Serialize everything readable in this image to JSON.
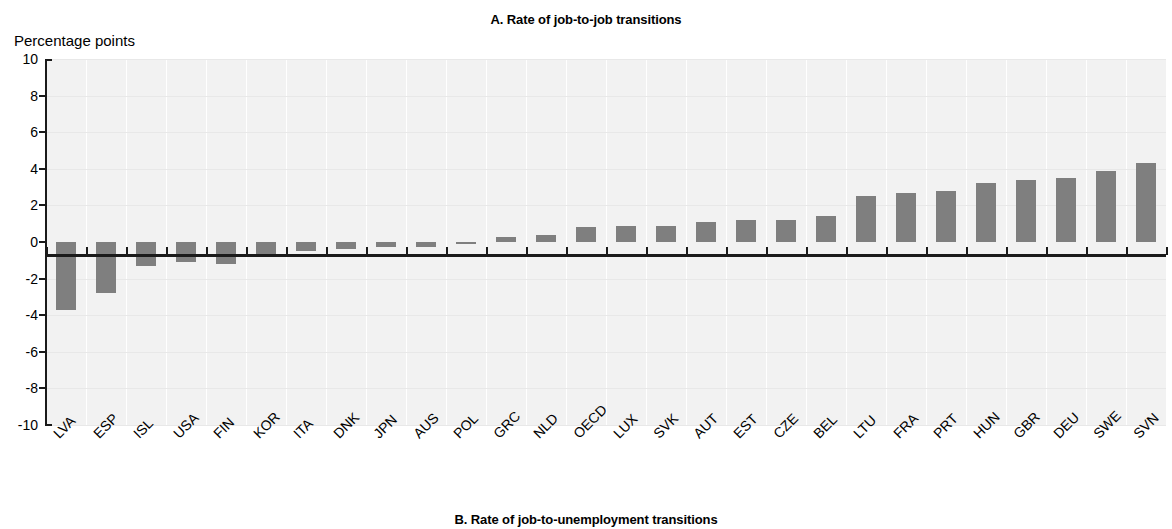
{
  "panel": {
    "title": "A. Rate of job-to-job transitions",
    "next_panel_title": "B. Rate of job-to-unemployment transitions",
    "axis_unit": "Percentage points"
  },
  "colors": {
    "bar": "#7f7f7f",
    "axis": "#1a1a1a",
    "plot_background": "#f2f2f2",
    "gridline": "#ffffff",
    "page_background": "#ffffff"
  },
  "chart_data": {
    "type": "bar",
    "title": "A. Rate of job-to-job transitions",
    "xlabel": "",
    "ylabel": "Percentage points",
    "ylim": [
      -10,
      10
    ],
    "ytick_labels": [
      "10",
      "8",
      "6",
      "4",
      "2",
      "0",
      "-2",
      "-4",
      "-6",
      "-8",
      "-10"
    ],
    "yticks": [
      10,
      8,
      6,
      4,
      2,
      0,
      -2,
      -4,
      -6,
      -8,
      -10
    ],
    "grid": "vertical",
    "legend": "none",
    "categories": [
      "LVA",
      "ESP",
      "ISL",
      "USA",
      "FIN",
      "KOR",
      "ITA",
      "DNK",
      "JPN",
      "AUS",
      "POL",
      "GRC",
      "NLD",
      "OECD",
      "LUX",
      "SVK",
      "AUT",
      "EST",
      "CZE",
      "BEL",
      "LTU",
      "FRA",
      "PRT",
      "HUN",
      "GBR",
      "DEU",
      "SWE",
      "SVN"
    ],
    "values": [
      -3.7,
      -2.8,
      -1.3,
      -1.1,
      -1.2,
      -0.7,
      -0.5,
      -0.4,
      -0.3,
      -0.25,
      -0.1,
      0.3,
      0.4,
      0.8,
      0.9,
      0.9,
      1.1,
      1.2,
      1.2,
      1.4,
      2.5,
      2.7,
      2.8,
      3.2,
      3.4,
      3.5,
      3.9,
      4.3
    ]
  }
}
